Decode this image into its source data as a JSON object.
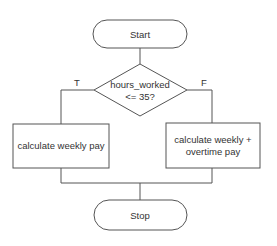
{
  "diagram": {
    "type": "flowchart",
    "nodes": {
      "start": {
        "label": "Start",
        "shape": "terminal"
      },
      "decision": {
        "line1": "hours_worked",
        "line2": "<= 35?",
        "shape": "diamond"
      },
      "process_true": {
        "label": "calculate weekly pay",
        "shape": "rectangle"
      },
      "process_false": {
        "line1": "calculate weekly +",
        "line2": "overtime pay",
        "shape": "rectangle"
      },
      "stop": {
        "label": "Stop",
        "shape": "terminal"
      }
    },
    "edges": {
      "true_label": "T",
      "false_label": "F"
    },
    "colors": {
      "stroke": "#555555",
      "text": "#333333",
      "background": "#ffffff"
    }
  }
}
